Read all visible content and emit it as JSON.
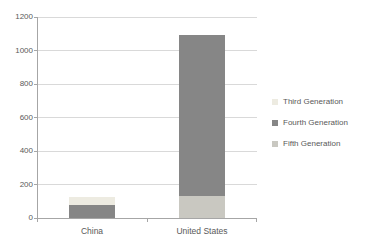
{
  "chart_data": {
    "type": "bar",
    "stacked": true,
    "title": "",
    "xlabel": "",
    "ylabel": "",
    "categories": [
      "China",
      "United States"
    ],
    "series": [
      {
        "name": "Third Generation",
        "color": "#EDEBE1",
        "values": [
          50,
          0
        ]
      },
      {
        "name": "Fourth Generation",
        "color": "#868686",
        "values": [
          75,
          965
        ]
      },
      {
        "name": "Fifth Generation",
        "color": "#C9C8C1",
        "values": [
          0,
          130
        ]
      }
    ],
    "totals": {
      "China": 125,
      "United States": 1095
    },
    "ylim": [
      0,
      1200
    ],
    "yticks": [
      0,
      200,
      400,
      600,
      800,
      1000,
      1200
    ],
    "grid": true,
    "legend_position": "right"
  },
  "colors": {
    "gridline": "#D9D9D9",
    "axis": "#A6A6A6",
    "tick_text": "#595959"
  }
}
